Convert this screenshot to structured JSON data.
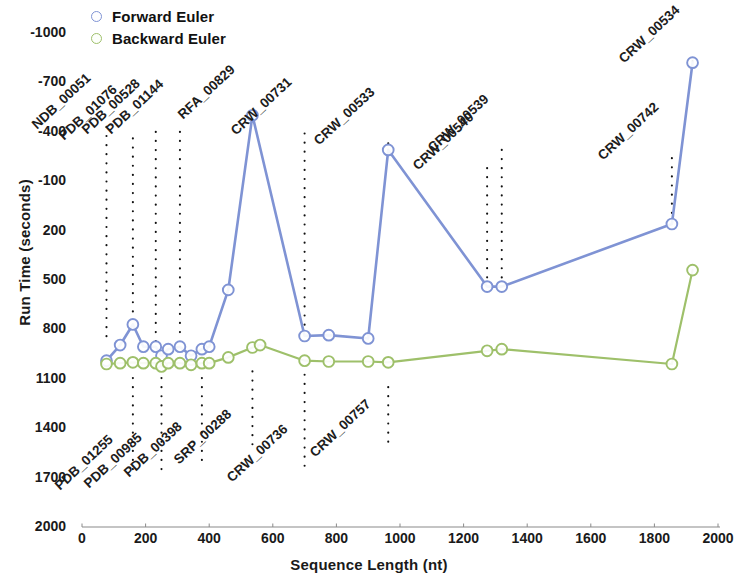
{
  "chart_data": {
    "type": "line",
    "title": "",
    "xlabel": "Sequence Length (nt)",
    "ylabel": "Run Time (seconds)",
    "xlim": [
      0,
      2000
    ],
    "ylim": [
      -1000,
      2000
    ],
    "xticks": [
      0,
      200,
      400,
      600,
      800,
      1000,
      1200,
      1400,
      1600,
      1800,
      2000
    ],
    "yticks": [
      -1000,
      -700,
      -400,
      -100,
      200,
      500,
      800,
      1100,
      1400,
      1700,
      2000
    ],
    "grid": false,
    "legend_position": "top-left",
    "series": [
      {
        "name": "Forward Euler",
        "color": "#7f93d4",
        "x": [
          77,
          120,
          160,
          193,
          232,
          250,
          271,
          308,
          343,
          377,
          400,
          460,
          536,
          700,
          776,
          900,
          963,
          1274,
          1320,
          1855,
          1920
        ],
        "values": [
          10,
          105,
          230,
          95,
          95,
          40,
          80,
          95,
          40,
          80,
          95,
          440,
          1500,
          160,
          165,
          145,
          1290,
          460,
          460,
          840,
          1820
        ]
      },
      {
        "name": "Backward Euler",
        "color": "#9ec06a",
        "x": [
          77,
          120,
          160,
          193,
          232,
          250,
          271,
          308,
          343,
          377,
          400,
          460,
          536,
          560,
          700,
          776,
          900,
          963,
          1274,
          1320,
          1855,
          1920
        ],
        "values": [
          -10,
          -5,
          0,
          -5,
          -5,
          -25,
          -5,
          -5,
          -15,
          -5,
          -5,
          30,
          90,
          105,
          10,
          5,
          5,
          0,
          70,
          80,
          -10,
          560
        ]
      }
    ],
    "point_labels_above": [
      {
        "text": "NDB_00051",
        "x": 77,
        "leader_from_y": 1430,
        "leader_to_y": 120
      },
      {
        "text": "PDB_01076",
        "x": 160,
        "leader_from_y": 1360,
        "leader_to_y": 290
      },
      {
        "text": "PDB_00528",
        "x": 232,
        "leader_from_y": 1400,
        "leader_to_y": 120
      },
      {
        "text": "PDB_01144",
        "x": 308,
        "leader_from_y": 1400,
        "leader_to_y": 130
      },
      {
        "text": "RFA_00829",
        "x": 536,
        "leader_from_y": 1490,
        "leader_to_y": 1500
      },
      {
        "text": "CRW_00731",
        "x": 700,
        "leader_from_y": 1390,
        "leader_to_y": 200
      },
      {
        "text": "CRW_00533",
        "x": 963,
        "leader_from_y": 1330,
        "leader_to_y": 1295
      },
      {
        "text": "CRW_00540",
        "x": 1274,
        "leader_from_y": 1180,
        "leader_to_y": 490
      },
      {
        "text": "CRW_00539",
        "x": 1320,
        "leader_from_y": 1290,
        "leader_to_y": 490
      },
      {
        "text": "CRW_00742",
        "x": 1855,
        "leader_from_y": 1240,
        "leader_to_y": 860
      },
      {
        "text": "CRW_00534",
        "x": 1920,
        "leader_from_y": 1830,
        "leader_to_y": 1825
      }
    ],
    "point_labels_below": [
      {
        "text": "PDB_01255",
        "x": 160,
        "leader_from_y": -95,
        "leader_to_y": -690
      },
      {
        "text": "PDB_00985",
        "x": 250,
        "leader_from_y": -95,
        "leader_to_y": -680
      },
      {
        "text": "PDB_00398",
        "x": 377,
        "leader_from_y": -95,
        "leader_to_y": -610
      },
      {
        "text": "SRP_00288",
        "x": 536,
        "leader_from_y": -55,
        "leader_to_y": -530
      },
      {
        "text": "CRW_00736",
        "x": 700,
        "leader_from_y": -75,
        "leader_to_y": -640
      },
      {
        "text": "CRW_00757",
        "x": 963,
        "leader_from_y": -150,
        "leader_to_y": -490
      }
    ]
  },
  "legend": {
    "items": [
      {
        "label": "Forward Euler"
      },
      {
        "label": "Backward Euler"
      }
    ]
  },
  "axes": {
    "y_title": "Run Time (seconds)",
    "x_title": "Sequence Length (nt)",
    "y_tick_labels": [
      "2000",
      "1700",
      "1400",
      "1100",
      "800",
      "500",
      "200",
      "-100",
      "-400",
      "-700",
      "-1000"
    ],
    "x_tick_labels": [
      "0",
      "200",
      "400",
      "600",
      "800",
      "1000",
      "1200",
      "1400",
      "1600",
      "1800",
      "2000"
    ]
  },
  "colors": {
    "forward": "#7f93d4",
    "backward": "#9ec06a",
    "axis": "#8a8a8a",
    "text": "#1a1a1a"
  }
}
